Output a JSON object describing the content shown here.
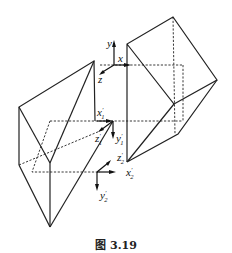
{
  "caption": "图 3.19",
  "axes": {
    "frame0": {
      "x": "x",
      "y": "y",
      "z": "z"
    },
    "frame1": {
      "x": "x",
      "y": "y",
      "z": "z",
      "prime": "′",
      "sub": "1"
    },
    "frame2": {
      "x": "x",
      "y": "y",
      "z": "z",
      "prime": "′",
      "sub": "2"
    }
  }
}
